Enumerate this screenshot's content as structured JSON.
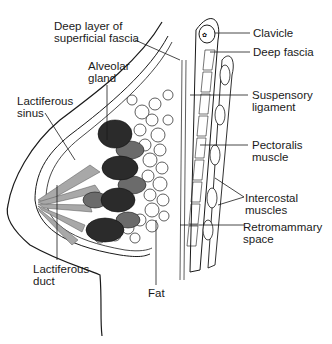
{
  "labels": {
    "deep_layer": "Deep layer of\nsuperficial fascia",
    "alveolar_gland": "Alveolar\ngland",
    "lactiferous_sinus": "Lactiferous\nsinus",
    "clavicle": "Clavicle",
    "deep_fascia": "Deep fascia",
    "suspensory_ligament": "Suspensory\nligament",
    "pectoralis_muscle": "Pectoralis\nmuscle",
    "intercostal_muscles": "Intercostal\nmuscles",
    "retromammary_space": "Retromammary\nspace",
    "lactiferous_duct": "Lactiferous\nduct",
    "fat": "Fat"
  },
  "colors": {
    "lobule_dark": "#2b2b2b",
    "lobule_mid": "#6b6b6b",
    "duct_light": "#a8a8a8",
    "outline": "#1a1a1a"
  }
}
